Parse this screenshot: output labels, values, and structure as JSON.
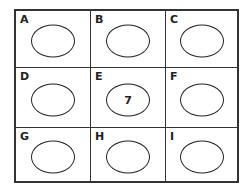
{
  "cells": [
    {
      "label": "A",
      "value": ""
    },
    {
      "label": "B",
      "value": ""
    },
    {
      "label": "C",
      "value": ""
    },
    {
      "label": "D",
      "value": ""
    },
    {
      "label": "E",
      "value": "7"
    },
    {
      "label": "F",
      "value": ""
    },
    {
      "label": "G",
      "value": ""
    },
    {
      "label": "H",
      "value": ""
    },
    {
      "label": "I",
      "value": ""
    }
  ]
}
